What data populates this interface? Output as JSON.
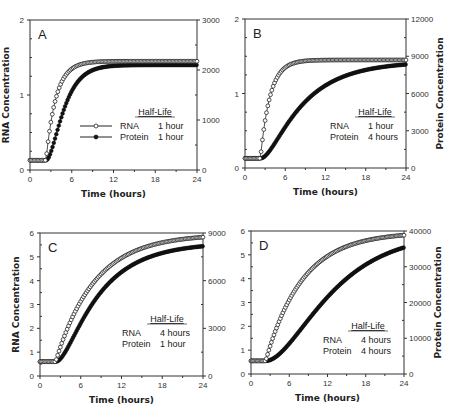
{
  "figure": {
    "panels": [
      {
        "id": "A",
        "letter": "A",
        "xlabel": "Time   (hours)",
        "ylabel_left": "RNA  Concentration",
        "ylabel_right": "",
        "legend_title": "Half-Life",
        "legend": [
          {
            "name": "RNA",
            "value": "1 hour",
            "marker": "open-circle"
          },
          {
            "name": "Protein",
            "value": "1 hour",
            "marker": "filled-circle"
          }
        ]
      },
      {
        "id": "B",
        "letter": "B",
        "xlabel": "Time   (hours)",
        "ylabel_left": "",
        "ylabel_right": "Protein  Concentration",
        "legend_title": "Half-Life",
        "legend": [
          {
            "name": "RNA",
            "value": "1 hour"
          },
          {
            "name": "Protein",
            "value": "4 hours"
          }
        ]
      },
      {
        "id": "C",
        "letter": "C",
        "xlabel": "Time   (hours)",
        "ylabel_left": "RNA  Concentration",
        "ylabel_right": "",
        "legend_title": "Half-Life",
        "legend": [
          {
            "name": "RNA",
            "value": "4 hours"
          },
          {
            "name": "Protein",
            "value": "1 hour"
          }
        ]
      },
      {
        "id": "D",
        "letter": "D",
        "xlabel": "Time   (hours)",
        "ylabel_left": "",
        "ylabel_right": "Protein  Concentration",
        "legend_title": "Half-Life",
        "legend": [
          {
            "name": "RNA",
            "value": "4 hours"
          },
          {
            "name": "Protein",
            "value": "4 hours"
          }
        ]
      }
    ]
  },
  "chart_data": [
    {
      "type": "scatter",
      "panel": "A",
      "title": "A",
      "xlabel": "Time (hours)",
      "ylabel": "RNA Concentration",
      "y2label": "",
      "xlim": [
        0,
        24
      ],
      "ylim": [
        0,
        2
      ],
      "y2lim": [
        0,
        3000
      ],
      "xticks": [
        0,
        6,
        12,
        18,
        24
      ],
      "yticks": [
        0,
        1,
        2
      ],
      "y2ticks": [
        0,
        1000,
        2000,
        3000
      ],
      "legend": {
        "title": "Half-Life",
        "position": "lower-right"
      },
      "model": {
        "t_on": 2.3,
        "rna_base": 0.13,
        "rna_plateau": 1.45,
        "rna_halflife": 1,
        "protein_base": 0.13,
        "protein_plateau": 1.4,
        "protein_halflife": 1
      },
      "series": [
        {
          "name": "RNA (1 hour)",
          "axis": "left",
          "marker": "open-circle",
          "x": [
            0,
            2,
            2.5,
            3,
            3.5,
            4,
            5,
            6,
            8,
            10,
            12,
            18,
            24
          ],
          "y": [
            0.13,
            0.13,
            0.32,
            0.6,
            0.85,
            1.03,
            1.25,
            1.37,
            1.44,
            1.45,
            1.45,
            1.45,
            1.45
          ]
        },
        {
          "name": "Protein (1 hour)",
          "axis": "right",
          "marker": "filled-circle",
          "x": [
            0,
            2,
            3,
            4,
            5,
            6,
            8,
            10,
            12,
            18,
            24
          ],
          "y": [
            195,
            195,
            400,
            900,
            1300,
            1600,
            1900,
            2030,
            2080,
            2100,
            2100
          ]
        }
      ]
    },
    {
      "type": "scatter",
      "panel": "B",
      "title": "B",
      "xlabel": "Time (hours)",
      "ylabel": "",
      "y2label": "Protein Concentration",
      "xlim": [
        0,
        24
      ],
      "ylim": [
        0,
        2
      ],
      "y2lim": [
        0,
        12000
      ],
      "xticks": [
        0,
        6,
        12,
        18,
        24
      ],
      "yticks": [
        0,
        1,
        2
      ],
      "y2ticks": [
        0,
        3000,
        6000,
        9000,
        12000
      ],
      "legend": {
        "title": "Half-Life",
        "position": "lower-right"
      },
      "model": {
        "t_on": 2.3,
        "rna_base": 0.13,
        "rna_plateau": 1.45,
        "rna_halflife": 1,
        "protein_base": 0.13,
        "protein_plateau": 1.43,
        "protein_halflife": 4
      },
      "series": [
        {
          "name": "RNA (1 hour)",
          "axis": "left",
          "marker": "open-circle",
          "x": [
            0,
            2,
            2.5,
            3,
            4,
            5,
            6,
            8,
            12,
            18,
            24
          ],
          "y": [
            0.13,
            0.13,
            0.32,
            0.6,
            1.03,
            1.25,
            1.37,
            1.44,
            1.45,
            1.45,
            1.45
          ]
        },
        {
          "name": "Protein (4 hours)",
          "axis": "right",
          "marker": "filled-circle",
          "x": [
            0,
            2,
            3,
            4,
            6,
            8,
            10,
            12,
            15,
            18,
            21,
            24
          ],
          "y": [
            780,
            780,
            900,
            1500,
            3000,
            4300,
            5300,
            6100,
            7000,
            7550,
            7900,
            8100
          ]
        }
      ]
    },
    {
      "type": "scatter",
      "panel": "C",
      "title": "C",
      "xlabel": "Time (hours)",
      "ylabel": "RNA Concentration",
      "y2label": "",
      "xlim": [
        0,
        24
      ],
      "ylim": [
        0,
        6
      ],
      "y2lim": [
        0,
        9000
      ],
      "xticks": [
        0,
        6,
        12,
        18,
        24
      ],
      "yticks": [
        0,
        1,
        2,
        3,
        4,
        5,
        6
      ],
      "y2ticks": [
        0,
        3000,
        6000,
        9000
      ],
      "legend": {
        "title": "Half-Life",
        "position": "lower-right"
      },
      "model": {
        "t_on": 2.3,
        "rna_base": 0.6,
        "rna_plateau": 5.95,
        "rna_halflife": 4,
        "protein_base": 0.6,
        "protein_plateau": 5.6,
        "protein_halflife": 1
      },
      "series": [
        {
          "name": "RNA (4 hours)",
          "axis": "left",
          "marker": "open-circle",
          "x": [
            0,
            2,
            3,
            4,
            6,
            8,
            10,
            12,
            15,
            18,
            21,
            24
          ],
          "y": [
            0.6,
            0.6,
            1.2,
            2.0,
            3.1,
            3.9,
            4.5,
            4.95,
            5.3,
            5.5,
            5.65,
            5.75
          ]
        },
        {
          "name": "Protein (1 hour)",
          "axis": "right",
          "marker": "filled-circle",
          "x": [
            0,
            2,
            3,
            4,
            6,
            8,
            10,
            12,
            15,
            18,
            21,
            24
          ],
          "y": [
            900,
            900,
            1200,
            2100,
            3900,
            5100,
            6000,
            6700,
            7400,
            7800,
            8050,
            8200
          ]
        }
      ]
    },
    {
      "type": "scatter",
      "panel": "D",
      "title": "D",
      "xlabel": "Time (hours)",
      "ylabel": "",
      "y2label": "Protein Concentration",
      "xlim": [
        0,
        24
      ],
      "ylim": [
        0,
        6
      ],
      "y2lim": [
        0,
        40000
      ],
      "xticks": [
        0,
        6,
        12,
        18,
        24
      ],
      "yticks": [
        0,
        1,
        2,
        3,
        4,
        5,
        6
      ],
      "y2ticks": [
        0,
        10000,
        20000,
        30000,
        40000
      ],
      "legend": {
        "title": "Half-Life",
        "position": "lower-right"
      },
      "model": {
        "t_on": 2.3,
        "rna_base": 0.55,
        "rna_plateau": 5.95,
        "rna_halflife": 4,
        "protein_base": 0.55,
        "protein_plateau": 5.9,
        "protein_halflife": 4
      },
      "series": [
        {
          "name": "RNA (4 hours)",
          "axis": "left",
          "marker": "open-circle",
          "x": [
            0,
            2,
            3,
            4,
            6,
            8,
            10,
            12,
            15,
            18,
            21,
            24
          ],
          "y": [
            0.55,
            0.55,
            1.2,
            1.9,
            3.0,
            3.9,
            4.5,
            4.9,
            5.3,
            5.5,
            5.65,
            5.7
          ]
        },
        {
          "name": "Protein (4 hours)",
          "axis": "right",
          "marker": "filled-circle",
          "x": [
            0,
            2,
            4,
            6,
            8,
            10,
            12,
            15,
            18,
            21,
            24
          ],
          "y": [
            3700,
            3700,
            4500,
            7000,
            10500,
            14500,
            18500,
            23000,
            26500,
            29000,
            30500
          ]
        }
      ]
    }
  ]
}
